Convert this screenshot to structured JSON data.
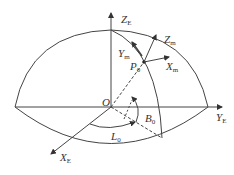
{
  "diagram": {
    "type": "coordinate-system",
    "colors": {
      "line": "#444444",
      "text": "#333333",
      "background": "#ffffff"
    },
    "labels": {
      "origin": "O",
      "z_axis": {
        "base": "Z",
        "sub": "E"
      },
      "y_axis": {
        "base": "Y",
        "sub": "E"
      },
      "x_axis": {
        "base": "X",
        "sub": "E"
      },
      "point": {
        "base": "P",
        "sub": "0"
      },
      "local_z": {
        "base": "Z",
        "sub": "m"
      },
      "local_y": {
        "base": "Y",
        "sub": "m"
      },
      "local_x": {
        "base": "X",
        "sub": "m"
      },
      "longitude": {
        "base": "L",
        "sub": "0"
      },
      "latitude": {
        "base": "B",
        "sub": "0"
      }
    }
  }
}
